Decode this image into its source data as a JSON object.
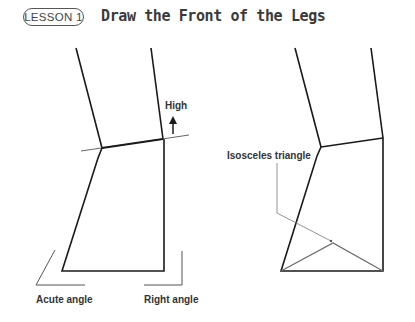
{
  "header": {
    "lesson_badge": "LESSON 1",
    "title": "Draw the Front of the Legs"
  },
  "left_figure": {
    "labels": {
      "high": "High",
      "acute_angle": "Acute angle",
      "right_angle": "Right angle"
    }
  },
  "right_figure": {
    "labels": {
      "isosceles_triangle": "Isosceles triangle"
    }
  },
  "colors": {
    "line": "#1a1a1a",
    "guide": "#777777",
    "text": "#333333"
  }
}
